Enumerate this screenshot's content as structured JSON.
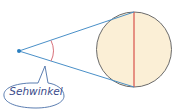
{
  "diagram": {
    "label": "Sehwinkel",
    "colors": {
      "sight_lines": "#4a90c8",
      "eye_dot": "#2a7fc0",
      "angle_arc": "#d9707a",
      "object_fill": "#fbefd6",
      "object_stroke": "#6b6b6b",
      "diameter_line": "#d9504a",
      "bubble_stroke": "#4a6fa8",
      "label_text": "#3a4a8a"
    }
  }
}
